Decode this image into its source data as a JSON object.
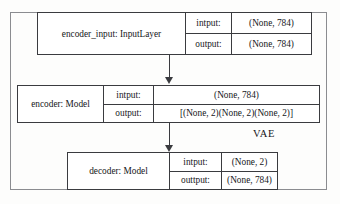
{
  "diagram": {
    "container_label": "VAE",
    "nodes": [
      {
        "name": "encoder_input: InputLayer",
        "input_key": "intput:",
        "input_value": "(None, 784)",
        "output_key": "output:",
        "output_value": "(None, 784)"
      },
      {
        "name": "encoder: Model",
        "input_key": "intput:",
        "input_value": "(None, 784)",
        "output_key": "output:",
        "output_value": "[(None, 2)(None, 2)(None, 2)]"
      },
      {
        "name": "decoder: Model",
        "input_key": "intput:",
        "input_value": "(None, 2)",
        "output_key": "outtput:",
        "output_value": "(None, 784)"
      }
    ]
  }
}
